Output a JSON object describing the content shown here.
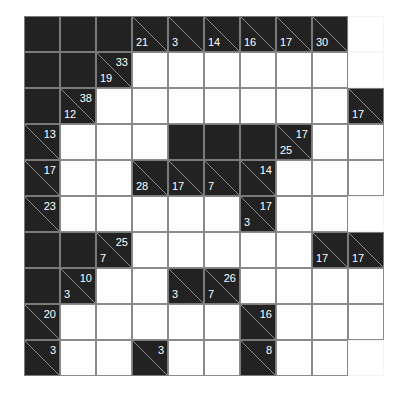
{
  "puzzle": {
    "type": "kakuro",
    "rows": 10,
    "cols": 10,
    "colors": {
      "block": "#222222",
      "white": "#ffffff",
      "grid_line": "#8a8a8a",
      "clue_text": "#ffffff"
    },
    "grid": [
      [
        {
          "t": "B"
        },
        {
          "t": "B"
        },
        {
          "t": "B"
        },
        {
          "t": "C",
          "down": "21"
        },
        {
          "t": "C",
          "down": "3"
        },
        {
          "t": "C",
          "down": "14"
        },
        {
          "t": "C",
          "down": "16"
        },
        {
          "t": "C",
          "down": "17"
        },
        {
          "t": "C",
          "down": "30"
        },
        {
          "t": "W",
          "nb": true
        }
      ],
      [
        {
          "t": "B"
        },
        {
          "t": "B"
        },
        {
          "t": "C",
          "right": "33",
          "down": "19"
        },
        {
          "t": "W"
        },
        {
          "t": "W"
        },
        {
          "t": "W"
        },
        {
          "t": "W"
        },
        {
          "t": "W"
        },
        {
          "t": "W"
        },
        {
          "t": "W",
          "nb": true
        }
      ],
      [
        {
          "t": "B"
        },
        {
          "t": "C",
          "right": "38",
          "down": "12"
        },
        {
          "t": "W"
        },
        {
          "t": "W"
        },
        {
          "t": "W"
        },
        {
          "t": "W"
        },
        {
          "t": "W"
        },
        {
          "t": "W"
        },
        {
          "t": "W"
        },
        {
          "t": "C",
          "down": "17"
        }
      ],
      [
        {
          "t": "C",
          "right": "13"
        },
        {
          "t": "W"
        },
        {
          "t": "W"
        },
        {
          "t": "W"
        },
        {
          "t": "B"
        },
        {
          "t": "B"
        },
        {
          "t": "B"
        },
        {
          "t": "C",
          "right": "17",
          "down": "25"
        },
        {
          "t": "W"
        },
        {
          "t": "W"
        }
      ],
      [
        {
          "t": "C",
          "right": "17"
        },
        {
          "t": "W"
        },
        {
          "t": "W"
        },
        {
          "t": "C",
          "down": "28"
        },
        {
          "t": "C",
          "down": "17"
        },
        {
          "t": "C",
          "down": "7"
        },
        {
          "t": "C",
          "right": "14"
        },
        {
          "t": "W"
        },
        {
          "t": "W"
        },
        {
          "t": "W"
        }
      ],
      [
        {
          "t": "C",
          "right": "23"
        },
        {
          "t": "W"
        },
        {
          "t": "W"
        },
        {
          "t": "W"
        },
        {
          "t": "W"
        },
        {
          "t": "W"
        },
        {
          "t": "C",
          "right": "17",
          "down": "3"
        },
        {
          "t": "W"
        },
        {
          "t": "W"
        },
        {
          "t": "W",
          "nb": true
        }
      ],
      [
        {
          "t": "B"
        },
        {
          "t": "B"
        },
        {
          "t": "C",
          "right": "25",
          "down": "7"
        },
        {
          "t": "W"
        },
        {
          "t": "W"
        },
        {
          "t": "W"
        },
        {
          "t": "W"
        },
        {
          "t": "W"
        },
        {
          "t": "C",
          "down": "17"
        },
        {
          "t": "C",
          "down": "17"
        }
      ],
      [
        {
          "t": "B"
        },
        {
          "t": "C",
          "right": "10",
          "down": "3"
        },
        {
          "t": "W"
        },
        {
          "t": "W"
        },
        {
          "t": "C",
          "down": "3"
        },
        {
          "t": "C",
          "right": "26",
          "down": "7"
        },
        {
          "t": "W"
        },
        {
          "t": "W"
        },
        {
          "t": "W"
        },
        {
          "t": "W"
        }
      ],
      [
        {
          "t": "C",
          "right": "20"
        },
        {
          "t": "W"
        },
        {
          "t": "W"
        },
        {
          "t": "W"
        },
        {
          "t": "W"
        },
        {
          "t": "W"
        },
        {
          "t": "C",
          "right": "16"
        },
        {
          "t": "W"
        },
        {
          "t": "W"
        },
        {
          "t": "W"
        }
      ],
      [
        {
          "t": "C",
          "right": "3"
        },
        {
          "t": "W"
        },
        {
          "t": "W"
        },
        {
          "t": "C",
          "right": "3"
        },
        {
          "t": "W"
        },
        {
          "t": "W"
        },
        {
          "t": "C",
          "right": "8"
        },
        {
          "t": "W"
        },
        {
          "t": "W"
        },
        {
          "t": "W",
          "nb": true
        }
      ]
    ]
  }
}
